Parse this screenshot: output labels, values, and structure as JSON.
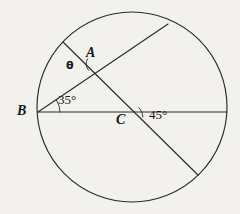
{
  "figure": {
    "type": "geometry-diagram",
    "background_color": "#f2f1ee",
    "stroke_color": "#2b2b2f",
    "text_color": "#161619",
    "width": 240,
    "height": 214
  },
  "circle": {
    "label": "circle",
    "center_x": 132,
    "center_y": 107,
    "radius": 95
  },
  "points": [
    {
      "id": "A",
      "label": "A",
      "x": 95,
      "y": 64,
      "label_x": 86,
      "label_y": 46
    },
    {
      "id": "B",
      "label": "B",
      "x": 38,
      "y": 112,
      "label_x": 17,
      "label_y": 104
    },
    {
      "id": "C",
      "label": "C",
      "x": 130,
      "y": 117,
      "label_x": 116,
      "label_y": 113
    }
  ],
  "segments": [
    {
      "name": "diameter-horizontal",
      "from_x": 38,
      "from_y": 112,
      "to_x": 227,
      "to_y": 112
    },
    {
      "name": "chord-B-to-top-right",
      "from_x": 38,
      "from_y": 112,
      "to_x": 168,
      "to_y": 24
    },
    {
      "name": "chord-upper-left-to-bottom-right",
      "from_x": 63,
      "from_y": 42,
      "to_x": 198,
      "to_y": 175
    }
  ],
  "angles": [
    {
      "id": "theta",
      "label": "θ",
      "vertex": "A",
      "label_x": 66,
      "label_y": 60,
      "arc_cx": 95,
      "arc_cy": 64,
      "arc_r": 9,
      "arc_start_deg": 135,
      "arc_end_deg": 214
    },
    {
      "id": "angle-35",
      "label": "35°",
      "vertex": "B",
      "label_x": 58,
      "label_y": 93,
      "arc_cx": 38,
      "arc_cy": 112,
      "arc_r": 22,
      "arc_start_deg": 0,
      "arc_end_deg": -34
    },
    {
      "id": "angle-45",
      "label": "45°",
      "vertex": "C",
      "label_x": 149,
      "label_y": 108,
      "arc_cx": 130,
      "arc_cy": 117,
      "arc_r": 13,
      "arc_start_deg": 0,
      "arc_end_deg": -45
    }
  ]
}
